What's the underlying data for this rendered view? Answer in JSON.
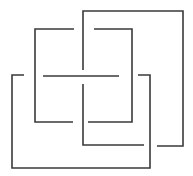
{
  "diagram": {
    "type": "knot-diagram",
    "width": 193,
    "height": 176,
    "background": "#ffffff",
    "stroke_color": "#3a3a3a",
    "stroke_width": 1.6,
    "strands": [
      {
        "name": "strand-big-square-top-right",
        "points": [
          [
            83,
            70
          ],
          [
            83,
            11
          ],
          [
            183,
            11
          ],
          [
            183,
            146
          ],
          [
            157,
            146
          ]
        ]
      },
      {
        "name": "strand-inner-top-right",
        "points": [
          [
            94,
            29
          ],
          [
            132,
            29
          ],
          [
            132,
            122
          ],
          [
            88,
            122
          ]
        ]
      },
      {
        "name": "strand-inner-left",
        "points": [
          [
            74,
            29
          ],
          [
            35,
            29
          ],
          [
            35,
            122
          ],
          [
            73,
            122
          ]
        ]
      },
      {
        "name": "strand-center-horizontal",
        "points": [
          [
            43,
            76
          ],
          [
            119,
            76
          ]
        ]
      },
      {
        "name": "strand-left-square",
        "points": [
          [
            24,
            75
          ],
          [
            12,
            75
          ],
          [
            12,
            168
          ],
          [
            150,
            168
          ],
          [
            150,
            75
          ],
          [
            138,
            75
          ]
        ]
      },
      {
        "name": "strand-lower-square",
        "points": [
          [
            83,
            84
          ],
          [
            83,
            145
          ],
          [
            144,
            145
          ]
        ]
      }
    ]
  }
}
